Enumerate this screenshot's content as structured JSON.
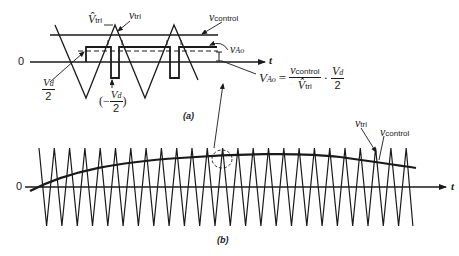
{
  "figure": {
    "panel_a": {
      "caption": "(a)",
      "axis_origin_label": "0",
      "axis_label": "t",
      "labels": {
        "v_tri_peak": "V̂",
        "v_tri_peak_sub": "tri",
        "v_tri": "v",
        "v_tri_sub": "tri",
        "v_control": "v",
        "v_control_sub": "control",
        "v_Ao": "v",
        "v_Ao_sub": "Ao",
        "vd_half_num": "V",
        "vd_half_num_sub": "d",
        "vd_half_den": "2",
        "neg_vd_half_open": "(−",
        "neg_vd_half_num": "V",
        "neg_vd_half_num_sub": "d",
        "neg_vd_half_den": "2",
        "neg_vd_half_close": ")"
      },
      "equation": {
        "lhs": "V",
        "lhs_sub": "Ao",
        "equals": "=",
        "frac1_num": "v",
        "frac1_num_sub": "control",
        "frac1_den": "V̂",
        "frac1_den_sub": "tri",
        "dot": "·",
        "frac2_num": "V",
        "frac2_num_sub": "d",
        "frac2_den": "2"
      }
    },
    "panel_b": {
      "caption": "(b)",
      "axis_origin_label": "0",
      "axis_label": "t",
      "labels": {
        "v_tri": "v",
        "v_tri_sub": "tri",
        "v_control": "v",
        "v_control_sub": "control"
      }
    },
    "colors": {
      "ink": "#1a1a1a",
      "background": "#ffffff"
    }
  }
}
